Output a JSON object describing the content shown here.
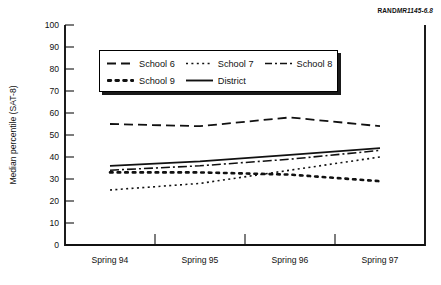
{
  "credit": {
    "brand": "RAND",
    "document": "MR1145-6.8"
  },
  "chart_data": {
    "type": "line",
    "title": "",
    "xlabel": "",
    "ylabel": "Median percentile (SAT-8)",
    "categories": [
      "Spring 94",
      "Spring 95",
      "Spring 96",
      "Spring 97"
    ],
    "ylim": [
      0,
      100
    ],
    "yticks": [
      0,
      10,
      20,
      30,
      40,
      50,
      60,
      70,
      80,
      90,
      100
    ],
    "grid": false,
    "legend_position": "upper-left-inside",
    "series": [
      {
        "name": "School 6",
        "style": "dashed",
        "values": [
          55,
          54,
          58,
          54
        ]
      },
      {
        "name": "School 7",
        "style": "dotted",
        "values": [
          25,
          28,
          34,
          40
        ]
      },
      {
        "name": "School 8",
        "style": "dash-dot",
        "values": [
          34,
          36,
          39,
          43
        ]
      },
      {
        "name": "School 9",
        "style": "thick-dot",
        "values": [
          33,
          33,
          32,
          29
        ]
      },
      {
        "name": "District",
        "style": "solid",
        "values": [
          36,
          38,
          41,
          44
        ]
      }
    ]
  },
  "legend": {
    "rows": [
      [
        {
          "label": "School 6",
          "swatch": "dashed-line-icon"
        },
        {
          "label": "School 7",
          "swatch": "dotted-line-icon"
        },
        {
          "label": "School 8",
          "swatch": "dash-dot-line-icon"
        }
      ],
      [
        {
          "label": "School 9",
          "swatch": "thick-dot-line-icon"
        },
        {
          "label": "District",
          "swatch": "solid-line-icon"
        }
      ]
    ]
  },
  "axes": {
    "ytick_labels": [
      "100",
      "90",
      "80",
      "70",
      "60",
      "50",
      "40",
      "30",
      "20",
      "10",
      "0"
    ],
    "xtick_labels": [
      "Spring 94",
      "Spring 95",
      "Spring 96",
      "Spring 97"
    ]
  }
}
